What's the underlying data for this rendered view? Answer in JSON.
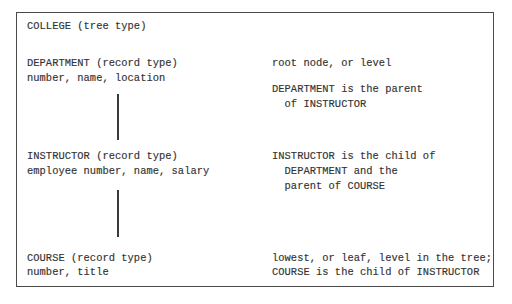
{
  "diagram": {
    "title": "COLLEGE (tree type)",
    "levels": [
      {
        "record_label": "DEPARTMENT (record type)",
        "fields": "number, name, location",
        "notes": [
          "root node, or level",
          "",
          "DEPARTMENT is the parent",
          "  of INSTRUCTOR"
        ]
      },
      {
        "record_label": "INSTRUCTOR (record type)",
        "fields": "employee number, name, salary",
        "notes": [
          "INSTRUCTOR is the child of",
          "  DEPARTMENT and the",
          "  parent of COURSE"
        ]
      },
      {
        "record_label": "COURSE (record type)",
        "fields": "number, title",
        "notes": [
          "lowest, or leaf, level in the tree;",
          "COURSE is the child of INSTRUCTOR"
        ]
      }
    ],
    "connectors": [
      {
        "from": "DEPARTMENT",
        "to": "INSTRUCTOR"
      },
      {
        "from": "INSTRUCTOR",
        "to": "COURSE"
      }
    ]
  }
}
